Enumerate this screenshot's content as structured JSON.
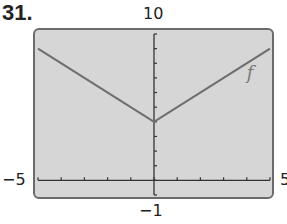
{
  "problem_number": "31.",
  "chart_data": {
    "type": "line",
    "title": "",
    "xlabel": "",
    "ylabel": "",
    "xlim": [
      -5,
      5
    ],
    "ylim": [
      -1,
      10
    ],
    "x_tick_step": 1,
    "y_tick_step": 1,
    "window_labels": {
      "ymax": "10",
      "ymin": "-1",
      "xmin": "-5",
      "xmax": "5"
    },
    "grid": false,
    "series": [
      {
        "name": "f",
        "x": [
          -5,
          0,
          5
        ],
        "y": [
          9,
          4,
          9
        ]
      }
    ],
    "annotations": [
      {
        "text": "f",
        "x": 4,
        "y": 7.5
      }
    ]
  },
  "labels": {
    "ymax": "10",
    "ymin": "−1",
    "xmin": "−5",
    "xmax": "5",
    "curve": "f"
  },
  "colors": {
    "screen": "#d6d6d6",
    "curve": "#6e6e6e",
    "axis": "#333333"
  }
}
